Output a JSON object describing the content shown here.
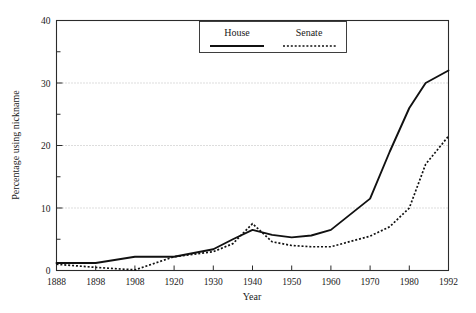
{
  "chart_data": {
    "type": "line",
    "title": "",
    "xlabel": "Year",
    "ylabel": "Percentage using nickname",
    "xlim": [
      1888,
      1992
    ],
    "ylim": [
      0,
      40
    ],
    "grid": true,
    "grid_values": [
      10,
      20,
      30
    ],
    "legend_position": "top-center-right",
    "x_ticks": [
      1888,
      1898,
      1908,
      1920,
      1930,
      1940,
      1950,
      1960,
      1970,
      1980,
      1992
    ],
    "x_tick_labels": [
      "1888",
      "1898",
      "1908",
      "1920",
      "1930",
      "1940",
      "1950",
      "1960",
      "1970",
      "1980",
      "1992"
    ],
    "y_ticks": [
      0,
      10,
      20,
      30,
      40
    ],
    "y_tick_labels": [
      "0",
      "10",
      "20",
      "30",
      "40"
    ],
    "y_minor_ticks": [
      5,
      15,
      25,
      35
    ],
    "series": [
      {
        "name": "House",
        "style": "solid",
        "color": "#111111",
        "x": [
          1888,
          1898,
          1908,
          1920,
          1930,
          1935,
          1940,
          1945,
          1950,
          1955,
          1960,
          1970,
          1975,
          1980,
          1985,
          1992
        ],
        "values": [
          1.2,
          1.2,
          2.2,
          2.2,
          3.4,
          5.0,
          6.5,
          5.7,
          5.3,
          5.6,
          6.5,
          11.5,
          19.0,
          26.0,
          30.0,
          32.0
        ]
      },
      {
        "name": "Senate",
        "style": "dotted",
        "color": "#111111",
        "x": [
          1888,
          1898,
          1908,
          1920,
          1930,
          1935,
          1940,
          1945,
          1950,
          1955,
          1960,
          1970,
          1975,
          1980,
          1985,
          1992
        ],
        "values": [
          1.0,
          0.5,
          0.1,
          2.2,
          3.0,
          4.3,
          7.5,
          4.6,
          4.0,
          3.8,
          3.8,
          5.5,
          7.0,
          10.0,
          17.0,
          21.5
        ]
      }
    ]
  },
  "legend": {
    "entries": [
      {
        "label": "House"
      },
      {
        "label": "Senate"
      }
    ]
  }
}
